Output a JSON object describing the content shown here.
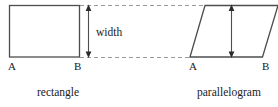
{
  "figure": {
    "background_color": "#ffffff",
    "stroke_color": "#4d4d4d",
    "dash_color": "#9a9a9a",
    "text_color": "#1a1a1a"
  },
  "rectangle": {
    "caption": "rectangle",
    "vertex_labels": {
      "bottom_left": "A",
      "bottom_right": "B"
    },
    "geometry": {
      "left": 9,
      "top": 5,
      "right": 80,
      "bottom": 57
    }
  },
  "parallelogram": {
    "caption": "parallelogram",
    "vertex_labels": {
      "bottom_left": "A",
      "bottom_right": "B"
    },
    "geometry": {
      "bottom_left_x": 190,
      "bottom_right_x": 262,
      "top_left_x": 205,
      "top_right_x": 277,
      "top": 5,
      "bottom": 57
    }
  },
  "dimension": {
    "label": "width",
    "rectangle_arrow_x": 88,
    "parallelogram_arrow_x": 231,
    "arrow_top_y": 5,
    "arrow_bottom_y": 57
  },
  "guides": {
    "top_dashed_y": 5,
    "bottom_dashed_y": 57,
    "top_dashed_start_x": 80,
    "top_dashed_end_x": 204,
    "bottom_dashed_start_x": 80,
    "bottom_dashed_end_x": 190
  }
}
